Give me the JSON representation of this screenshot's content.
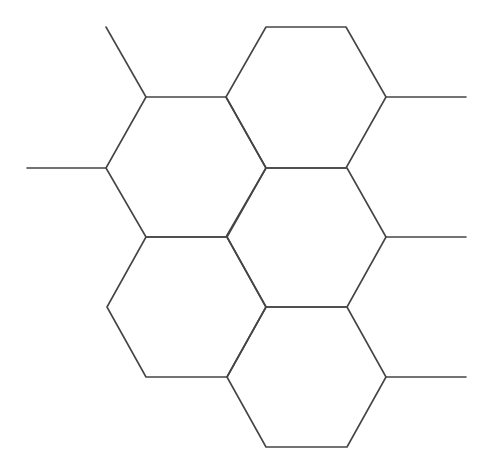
{
  "diagram": {
    "type": "hexagonal-lattice",
    "background": "#ffffff",
    "stroke_color": "#454545",
    "stroke_width": 1.6,
    "width": 485,
    "height": 461,
    "hexagons": [
      {
        "id": "hex-top-left",
        "points": [
          [
            146,
            97
          ],
          [
            226,
            97
          ],
          [
            266,
            168
          ],
          [
            226,
            237
          ],
          [
            146,
            237
          ],
          [
            106,
            168
          ]
        ]
      },
      {
        "id": "hex-top-right",
        "points": [
          [
            266,
            27
          ],
          [
            346,
            27
          ],
          [
            386,
            97
          ],
          [
            346,
            168
          ],
          [
            266,
            168
          ],
          [
            226,
            97
          ]
        ]
      },
      {
        "id": "hex-middle-right",
        "points": [
          [
            266,
            168
          ],
          [
            347,
            168
          ],
          [
            386,
            237
          ],
          [
            347,
            307
          ],
          [
            266,
            307
          ],
          [
            227,
            237
          ]
        ]
      },
      {
        "id": "hex-bottom-left",
        "points": [
          [
            146,
            237
          ],
          [
            227,
            237
          ],
          [
            266,
            307
          ],
          [
            227,
            377
          ],
          [
            146,
            377
          ],
          [
            107,
            307
          ]
        ]
      },
      {
        "id": "hex-bottom-right",
        "points": [
          [
            266,
            307
          ],
          [
            347,
            307
          ],
          [
            386,
            377
          ],
          [
            347,
            447
          ],
          [
            266,
            447
          ],
          [
            227,
            377
          ]
        ]
      }
    ],
    "tails": [
      {
        "id": "tail-top-left-diagonal",
        "from": [
          106,
          27
        ],
        "to": [
          146,
          97
        ]
      },
      {
        "id": "tail-left",
        "from": [
          27,
          168
        ],
        "to": [
          106,
          168
        ]
      },
      {
        "id": "tail-right-top",
        "from": [
          386,
          97
        ],
        "to": [
          466,
          97
        ]
      },
      {
        "id": "tail-right-middle",
        "from": [
          386,
          237
        ],
        "to": [
          466,
          237
        ]
      },
      {
        "id": "tail-right-bottom",
        "from": [
          386,
          377
        ],
        "to": [
          466,
          377
        ]
      }
    ]
  }
}
